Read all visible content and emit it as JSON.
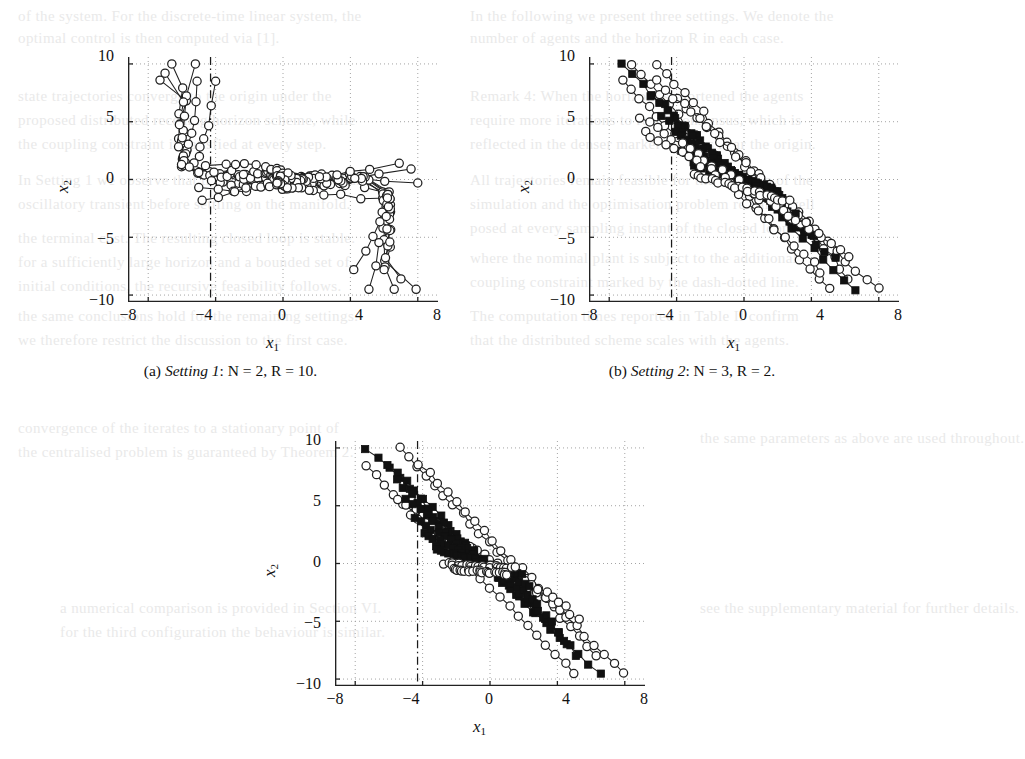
{
  "figure": {
    "kind": "multi-panel-scatter-line-figure",
    "panel_count": 3,
    "shared": {
      "xlabel": "x1",
      "ylabel": "x2",
      "xticks": [
        "−8",
        "−4",
        "0",
        "4",
        "8"
      ],
      "yticks": [
        "10",
        "5",
        "0",
        "−5",
        "−10"
      ],
      "xlim": [
        -9.2,
        9.2
      ],
      "ylim": [
        -10.6,
        10.6
      ],
      "grid": "dotted",
      "constraint_line_x": -4.3,
      "constraint_line_style": "dash-dot"
    },
    "panels": [
      {
        "id": "a",
        "caption_label": "(a)",
        "caption_setting": "Setting 1",
        "caption_params": ": N = 2, R = 10.",
        "caption_full": "(a) Setting 1: N = 2, R = 10.",
        "markers": [
          "open-circle"
        ]
      },
      {
        "id": "b",
        "caption_label": "(b)",
        "caption_setting": "Setting 2",
        "caption_params": ": N = 3, R = 2.",
        "caption_full": "(b) Setting 2: N = 3, R = 2.",
        "markers": [
          "open-circle",
          "filled-square"
        ]
      },
      {
        "id": "c",
        "caption_label": "",
        "caption_setting": "",
        "caption_params": "",
        "caption_full": "",
        "markers": [
          "open-circle",
          "filled-square"
        ]
      }
    ]
  },
  "colors": {
    "ink": "#1a1a1a",
    "grid": "#9a9a9a",
    "frame": "#222222",
    "marker_fill_open": "#ffffff",
    "marker_fill_solid": "#111111",
    "bleed": "#d8d8d8"
  },
  "bleed_text": [
    {
      "t": "of the system. For the discrete-time linear system, the",
      "x": 18,
      "y": 8
    },
    {
      "t": "optimal control is then computed via [1].",
      "x": 18,
      "y": 30
    },
    {
      "t": "In the following we present three settings. We denote the",
      "x": 470,
      "y": 8
    },
    {
      "t": "number of agents and the horizon R in each case.",
      "x": 470,
      "y": 30
    },
    {
      "t": "state trajectories converge to the origin under the",
      "x": 18,
      "y": 88
    },
    {
      "t": "proposed distributed receding horizon scheme, while",
      "x": 18,
      "y": 112
    },
    {
      "t": "the coupling constraint is satisfied at every step.",
      "x": 18,
      "y": 136
    },
    {
      "t": "Remark 4: When the horizon is shortened the agents",
      "x": 470,
      "y": 88
    },
    {
      "t": "require more iterations to reach consensus, which is",
      "x": 470,
      "y": 112
    },
    {
      "t": "reflected in the denser marker clusters near the origin.",
      "x": 470,
      "y": 136
    },
    {
      "t": "In Setting 1 we observe that the trajectories exhibit an",
      "x": 18,
      "y": 172
    },
    {
      "t": "oscillatory transient before settling on the manifold.",
      "x": 18,
      "y": 196
    },
    {
      "t": "All trajectories remain feasible for the duration of the",
      "x": 470,
      "y": 172
    },
    {
      "t": "simulation and the optimisation problem remains well",
      "x": 470,
      "y": 196
    },
    {
      "t": "posed at every sampling instant of the closed loop.",
      "x": 470,
      "y": 220
    },
    {
      "t": "the terminal cost. The resulting closed loop is stable.",
      "x": 18,
      "y": 230
    },
    {
      "t": "for a sufficiently large horizon and a bounded set of",
      "x": 18,
      "y": 254
    },
    {
      "t": "initial conditions, the recursive feasibility follows.",
      "x": 18,
      "y": 278
    },
    {
      "t": "where the nominal plant is subject to the additional",
      "x": 470,
      "y": 250
    },
    {
      "t": "coupling constraint marked by the dash-dotted line.",
      "x": 470,
      "y": 274
    },
    {
      "t": "the same conclusions hold for the remaining settings.",
      "x": 18,
      "y": 308
    },
    {
      "t": "we therefore restrict the discussion to the first case.",
      "x": 18,
      "y": 332
    },
    {
      "t": "The computation times reported in Table II confirm",
      "x": 470,
      "y": 308
    },
    {
      "t": "that the distributed scheme scales with the agents.",
      "x": 470,
      "y": 332
    },
    {
      "t": "convergence of the iterates to a stationary point of",
      "x": 18,
      "y": 420
    },
    {
      "t": "the centralised problem is guaranteed by Theorem 2.",
      "x": 18,
      "y": 444
    },
    {
      "t": "the same parameters as above are used throughout.",
      "x": 700,
      "y": 430
    },
    {
      "t": "a numerical comparison is provided in Section VI.",
      "x": 60,
      "y": 600
    },
    {
      "t": "for the third configuration the behaviour is similar.",
      "x": 60,
      "y": 624
    },
    {
      "t": "see the supplementary material for further details.",
      "x": 700,
      "y": 600
    }
  ]
}
